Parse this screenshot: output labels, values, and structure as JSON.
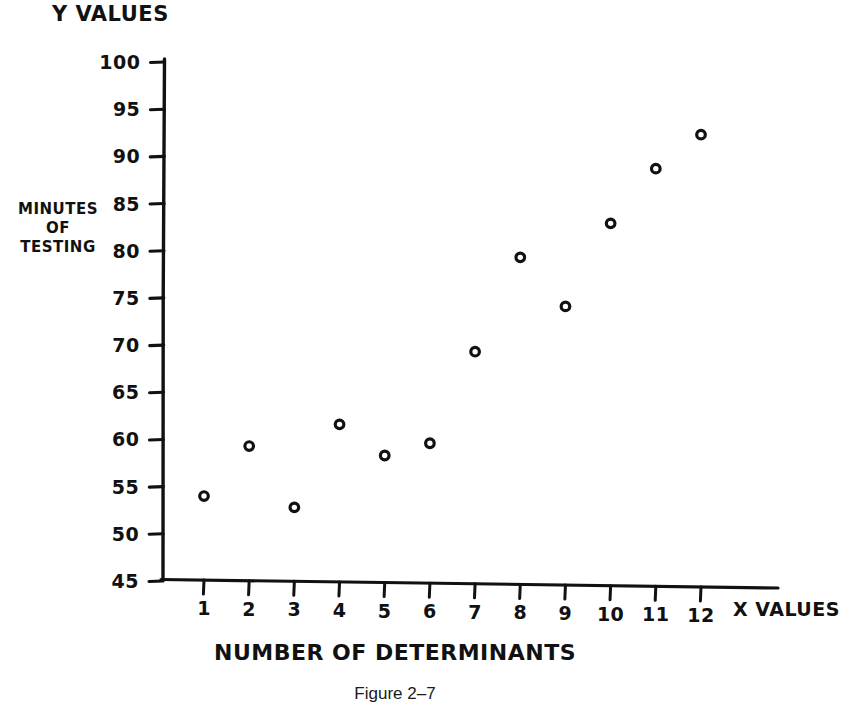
{
  "figure": {
    "caption": "Figure 2–7",
    "y_axis_title": "Y VALUES",
    "y_axis_subtitle_lines": [
      "MINUTES",
      "OF",
      "TESTING"
    ],
    "x_axis_title": "NUMBER OF DETERMINANTS",
    "x_axis_end_label": "X VALUES",
    "ink_color": "#111111",
    "background_color": "#ffffff"
  },
  "chart_data": {
    "type": "scatter",
    "title": "",
    "xlabel": "NUMBER OF DETERMINANTS",
    "ylabel": "MINUTES OF TESTING",
    "x_axis_name": "X VALUES",
    "y_axis_name": "Y VALUES",
    "xlim": [
      0,
      13
    ],
    "ylim": [
      45,
      100
    ],
    "xticks": [
      1,
      2,
      3,
      4,
      5,
      6,
      7,
      8,
      9,
      10,
      11,
      12
    ],
    "xtick_labels": [
      "1",
      "2",
      "3",
      "4",
      "5",
      "6",
      "7",
      "8",
      "9",
      "10",
      "11",
      "12"
    ],
    "yticks": [
      45,
      50,
      55,
      60,
      65,
      70,
      75,
      80,
      85,
      90,
      95,
      100
    ],
    "ytick_labels": [
      "45",
      "50",
      "55",
      "60",
      "65",
      "70",
      "75",
      "80",
      "85",
      "90",
      "95",
      "100"
    ],
    "grid": false,
    "legend": null,
    "marker": "open-circle",
    "x": [
      1,
      2,
      3,
      4,
      5,
      6,
      7,
      8,
      9,
      10,
      11,
      12
    ],
    "values": [
      54.0,
      59.3,
      52.8,
      61.6,
      58.3,
      59.6,
      69.3,
      79.3,
      74.1,
      82.9,
      88.7,
      92.3
    ],
    "points": [
      {
        "x": 1,
        "y": 54.0
      },
      {
        "x": 2,
        "y": 59.3
      },
      {
        "x": 3,
        "y": 52.8
      },
      {
        "x": 4,
        "y": 61.6
      },
      {
        "x": 5,
        "y": 58.3
      },
      {
        "x": 6,
        "y": 59.6
      },
      {
        "x": 7,
        "y": 69.3
      },
      {
        "x": 8,
        "y": 79.3
      },
      {
        "x": 9,
        "y": 74.1
      },
      {
        "x": 10,
        "y": 82.9
      },
      {
        "x": 11,
        "y": 88.7
      },
      {
        "x": 12,
        "y": 92.3
      }
    ]
  }
}
